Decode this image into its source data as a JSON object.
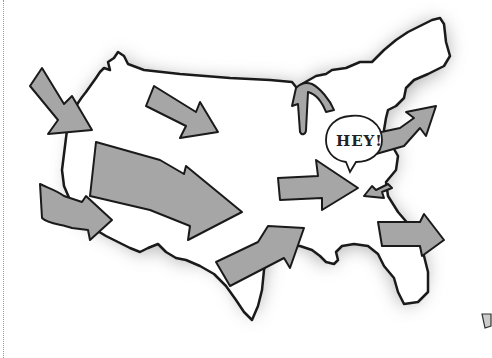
{
  "illustration": {
    "subject": "Cartoon map of the United States with arrows pointing inward",
    "speech_bubble": {
      "text": "HEY!"
    },
    "arrows": [
      {
        "name": "arrow-pacific-northwest",
        "direction": "southeast"
      },
      {
        "name": "arrow-northern-plains",
        "direction": "southeast"
      },
      {
        "name": "arrow-california",
        "direction": "east"
      },
      {
        "name": "arrow-west-large",
        "direction": "east-southeast"
      },
      {
        "name": "arrow-texas",
        "direction": "northeast"
      },
      {
        "name": "arrow-great-lakes-curved",
        "direction": "down-curved"
      },
      {
        "name": "arrow-midwest",
        "direction": "east"
      },
      {
        "name": "arrow-small-ohio",
        "direction": "west"
      },
      {
        "name": "arrow-northeast",
        "direction": "northeast"
      },
      {
        "name": "arrow-southeast",
        "direction": "east"
      }
    ],
    "colors": {
      "arrow_fill": "#a6a6a6",
      "outline": "#1a1a1a",
      "map_fill": "#ffffff",
      "shadow": "#9a9a9a"
    }
  }
}
